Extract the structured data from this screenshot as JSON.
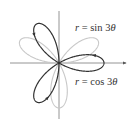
{
  "chart_data": {
    "type": "line",
    "subtype": "polar-rose",
    "title": "",
    "axes": {
      "show": true,
      "x_arrow": true,
      "y_arrow": false
    },
    "series": [
      {
        "name": "r = sin 3θ",
        "equation": "r = sin(3θ)",
        "k": 3,
        "func": "sin",
        "color": "#c8c8c8",
        "petal_angles_deg": [
          30,
          150,
          270
        ],
        "amplitude": 1,
        "direction_arrows": false
      },
      {
        "name": "r = cos 3θ",
        "equation": "r = cos(3θ)",
        "k": 3,
        "func": "cos",
        "color": "#333333",
        "petal_angles_deg": [
          0,
          120,
          240
        ],
        "amplitude": 1,
        "direction_arrows": true
      }
    ],
    "legend": "inline labels, right side"
  },
  "labels": {
    "sin": {
      "r": "r",
      "eq": " = sin 3",
      "theta": "θ"
    },
    "cos": {
      "r": "r",
      "eq": " = cos 3",
      "theta": "θ"
    }
  },
  "colors": {
    "axis": "#7a7a7a",
    "sin_curve": "#c8c8c8",
    "cos_curve": "#333333",
    "text": "#333333"
  },
  "geometry": {
    "origin_x": 59,
    "origin_y": 63,
    "radius_px": 45,
    "x_axis_from": 10,
    "x_axis_to": 126,
    "y_axis_from": 11,
    "y_axis_to": 119
  }
}
